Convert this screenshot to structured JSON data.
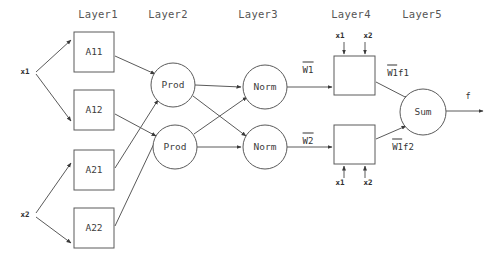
{
  "diagram": {
    "type": "neural-network-architecture",
    "stroke_color": "#4a4a4a",
    "text_color": "#3a3a3a",
    "layer_labels": [
      {
        "id": "layer1",
        "text": "Layer1",
        "x": 98,
        "y": 14
      },
      {
        "id": "layer2",
        "text": "Layer2",
        "x": 168,
        "y": 14
      },
      {
        "id": "layer3",
        "text": "Layer3",
        "x": 258,
        "y": 14
      },
      {
        "id": "layer4",
        "text": "Layer4",
        "x": 351,
        "y": 14
      },
      {
        "id": "layer5",
        "text": "Layer5",
        "x": 422,
        "y": 14
      }
    ],
    "inputs": [
      {
        "id": "input-x1",
        "text": "x1",
        "x": 25,
        "y": 72
      },
      {
        "id": "input-x2",
        "text": "x2",
        "x": 25,
        "y": 215
      }
    ],
    "membership_nodes": [
      {
        "id": "a11",
        "text": "A11",
        "x": 94,
        "y": 52
      },
      {
        "id": "a12",
        "text": "A12",
        "x": 94,
        "y": 110
      },
      {
        "id": "a21",
        "text": "A21",
        "x": 94,
        "y": 170
      },
      {
        "id": "a22",
        "text": "A22",
        "x": 94,
        "y": 228
      }
    ],
    "rule_nodes": [
      {
        "id": "prod-1",
        "text": "Prod",
        "x": 173,
        "y": 85
      },
      {
        "id": "prod-2",
        "text": "Prod",
        "x": 175,
        "y": 147
      }
    ],
    "norm_nodes": [
      {
        "id": "norm-1",
        "text": "Norm",
        "x": 265,
        "y": 87
      },
      {
        "id": "norm-2",
        "text": "Norm",
        "x": 265,
        "y": 147
      }
    ],
    "consequent_nodes": [
      {
        "id": "consequent-1",
        "x": 354,
        "y": 75
      },
      {
        "id": "consequent-2",
        "x": 354,
        "y": 144
      }
    ],
    "sum_node": {
      "id": "sum",
      "text": "Sum",
      "x": 423,
      "y": 112
    },
    "weight_labels": [
      {
        "id": "w1",
        "text": "W1",
        "overbar": true,
        "x": 308,
        "y": 70
      },
      {
        "id": "w2",
        "text": "W2",
        "overbar": true,
        "x": 308,
        "y": 141
      },
      {
        "id": "w1f1",
        "text": "W1f1",
        "overbar": true,
        "x": 398,
        "y": 73
      },
      {
        "id": "w1f2",
        "text": "W1f2",
        "overbar": true,
        "x": 403,
        "y": 147
      }
    ],
    "consequent_inputs": [
      {
        "id": "top-box-x1",
        "text": "x1",
        "x": 340,
        "y": 36
      },
      {
        "id": "top-box-x2",
        "text": "x2",
        "x": 368,
        "y": 36
      },
      {
        "id": "bottom-box-x1",
        "text": "x1",
        "x": 340,
        "y": 183
      },
      {
        "id": "bottom-box-x2",
        "text": "x2",
        "x": 368,
        "y": 183
      }
    ],
    "output": {
      "id": "output-f",
      "text": "f",
      "x": 468,
      "y": 96
    }
  }
}
